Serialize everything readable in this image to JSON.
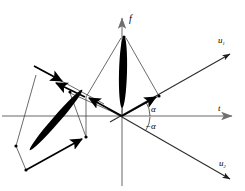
{
  "figure": {
    "background": "#ffffff",
    "width": 245,
    "height": 191
  },
  "colors": {
    "axis_gray": "#9a9a9a",
    "axis_dark": "#2b2b2b",
    "vector_black": "#000000",
    "fill_black": "#000000",
    "thin_line": "#3a3a3a"
  },
  "axes": [
    {
      "id": "f-axis",
      "label": "f",
      "label_sub": "",
      "color": "#9a9a9a",
      "orientation": "vertical",
      "x1": 122,
      "y1": 186,
      "x2": 122,
      "y2": 14,
      "label_x": 128,
      "label_y": 20,
      "arrow": "up"
    },
    {
      "id": "t-axis",
      "label": "t",
      "label_sub": "",
      "color": "#9a9a9a",
      "orientation": "horizontal",
      "x1": 2,
      "y1": 116,
      "x2": 238,
      "y2": 116,
      "label_x": 219,
      "label_y": 110,
      "arrow": "right"
    },
    {
      "id": "u1-axis",
      "label": "u",
      "label_sub": "1",
      "color": "#2b2b2b",
      "orientation": "diagonal-up-right",
      "x1": 122,
      "y1": 116,
      "x2": 236,
      "y2": 52,
      "label_x": 221,
      "label_y": 42,
      "arrow": "upright"
    },
    {
      "id": "u2-axis",
      "label": "u",
      "label_sub": "2",
      "color": "#2b2b2b",
      "orientation": "diagonal-down-right",
      "x1": 122,
      "y1": 116,
      "x2": 236,
      "y2": 182,
      "label_x": 222,
      "label_y": 164,
      "arrow": "downright"
    }
  ],
  "angles": [
    {
      "id": "alpha-positive",
      "label": "α",
      "x": 151,
      "y": 111,
      "arc_radius": 22
    },
    {
      "id": "alpha-negative",
      "label": "−α",
      "x": 147,
      "y": 127,
      "arc_radius": 20
    }
  ],
  "lenses": [
    {
      "id": "vertical-lens",
      "description": "filled black lens along f axis",
      "cx": 123,
      "cy": 72,
      "rx": 4.0,
      "ry": 36,
      "rotation": 2
    },
    {
      "id": "tilted-lens",
      "description": "filled black lens tilted in lower-left quadrant",
      "cx": 56,
      "cy": 120,
      "rx": 3.6,
      "ry": 40,
      "rotation": 41
    }
  ],
  "points": [
    {
      "id": "origin",
      "x": 122,
      "y": 116
    },
    {
      "id": "lens-top",
      "x": 124,
      "y": 37
    },
    {
      "id": "u1-point",
      "x": 158,
      "y": 96
    },
    {
      "id": "left-node-a",
      "x": 70,
      "y": 92
    },
    {
      "id": "left-node-b",
      "x": 85,
      "y": 97
    },
    {
      "id": "left-tip",
      "x": 36,
      "y": 75
    },
    {
      "id": "lower-left",
      "x": 16,
      "y": 146
    },
    {
      "id": "lower-node",
      "x": 26,
      "y": 170
    },
    {
      "id": "lower-right",
      "x": 86,
      "y": 137
    }
  ],
  "vectors": [
    {
      "id": "vector-u1",
      "from": "origin",
      "to": "u1-point",
      "style": "thick-arrow"
    },
    {
      "id": "vector-left-upper",
      "from": "left-node-b",
      "to": "left-tip",
      "style": "thick-arrow"
    },
    {
      "id": "vector-left-inner",
      "from": "origin",
      "to": "left-node-b",
      "style": "thick-arrow"
    },
    {
      "id": "vector-lower",
      "from": "lower-node",
      "to": "lower-right",
      "style": "thick-arrow"
    }
  ],
  "construction_lines": [
    {
      "id": "line-lenstop-origin",
      "from": "lens-top",
      "to": "origin"
    },
    {
      "id": "line-lenstop-u1point",
      "from": "lens-top",
      "to": "u1-point"
    },
    {
      "id": "line-lenstop-leftnode",
      "from": "lens-top",
      "to": "left-node-a"
    },
    {
      "id": "line-origin-u1point",
      "from": "origin",
      "to": "u1-point"
    },
    {
      "id": "line-leftnode-lower",
      "from": "left-node-a",
      "to": "lower-right"
    },
    {
      "id": "line-lowerleft-node",
      "from": "lower-left",
      "to": "lower-node"
    },
    {
      "id": "line-lefttip-lens",
      "from": "left-tip",
      "to": "lower-left"
    }
  ]
}
